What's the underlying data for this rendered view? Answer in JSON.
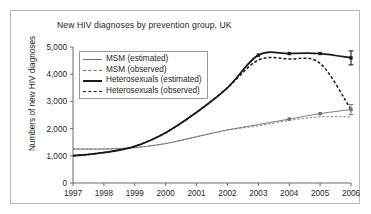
{
  "chart_data": {
    "type": "line",
    "title": "New HIV diagnoses by prevention group, UK",
    "xlabel": "",
    "ylabel": "Numbers of new HIV diagnoses",
    "x": [
      1997,
      1998,
      1999,
      2000,
      2001,
      2002,
      2003,
      2004,
      2005,
      2006
    ],
    "xticklabels": [
      "1997",
      "1998",
      "1999",
      "2000",
      "2001",
      "2002",
      "2003",
      "2004",
      "2005",
      "2006"
    ],
    "yticklabels": [
      "0",
      "1,000",
      "2,000",
      "3,000",
      "4,000",
      "5,000"
    ],
    "ytickvalues": [
      0,
      1000,
      2000,
      3000,
      4000,
      5000
    ],
    "ylim": [
      0,
      5000
    ],
    "xlim": [
      1997,
      2006
    ],
    "grid": false,
    "legend_position": "upper left",
    "series": [
      {
        "name": "MSM (estimated)",
        "style": "thin-solid",
        "color": "#6f6f6f",
        "values": [
          1250,
          1250,
          1300,
          1450,
          1700,
          1950,
          2150,
          2350,
          2550,
          2700
        ],
        "markers_at": [
          2004,
          2005,
          2006
        ],
        "errorbar_at": 2006
      },
      {
        "name": "MSM (observed)",
        "style": "thin-dashed",
        "color": "#6f6f6f",
        "values": [
          1250,
          1250,
          1300,
          1450,
          1700,
          1950,
          2100,
          2300,
          2430,
          2430
        ],
        "markers_at": [],
        "errorbar_at": null
      },
      {
        "name": "Heterosexuals (estimated)",
        "style": "thick-solid",
        "color": "#1a1a1a",
        "values": [
          1000,
          1120,
          1350,
          1850,
          2600,
          3500,
          4700,
          4760,
          4760,
          4600
        ],
        "markers_at": [
          2003,
          2004,
          2005,
          2006
        ],
        "errorbar_at": 2006
      },
      {
        "name": "Heterosexuals (observed)",
        "style": "thick-dashed",
        "color": "#1a1a1a",
        "values": [
          1000,
          1120,
          1350,
          1850,
          2600,
          3500,
          4520,
          4560,
          4400,
          2700
        ],
        "markers_at": [],
        "errorbar_at": null
      }
    ],
    "legend": [
      {
        "label": "MSM (estimated)",
        "swatch": "sw-thin-solid"
      },
      {
        "label": "MSM (observed)",
        "swatch": "sw-thin-dash"
      },
      {
        "label": "Heterosexuals (estimated)",
        "swatch": "sw-thick-solid"
      },
      {
        "label": "Heterosexuals (observed)",
        "swatch": "sw-thick-dash"
      }
    ],
    "colors": {
      "msm": "#6f6f6f",
      "heterosexuals": "#1a1a1a",
      "axis": "#5a5a5a",
      "frame": "#b9b9b9",
      "text": "#231f20"
    }
  }
}
